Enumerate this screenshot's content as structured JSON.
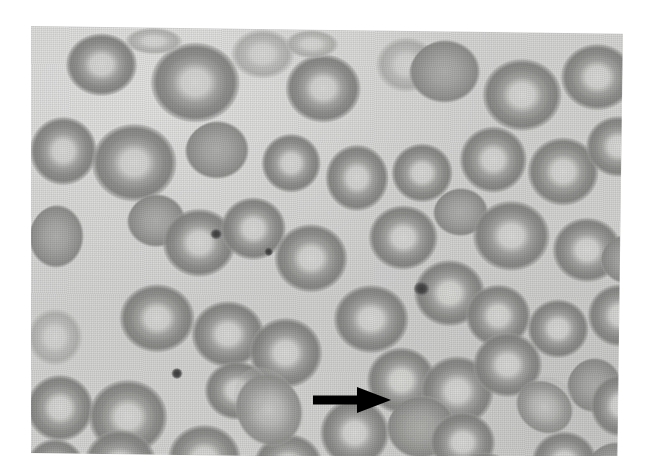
{
  "figure": {
    "kind": "light-microscopy-photomicrograph",
    "staining": "romanowsky-type, reproduced in grayscale",
    "background_color": "#d7d7d5",
    "cell_color": "#a0a0a0",
    "annotation_color": "#000000",
    "page_background": "#ffffff",
    "caption": "",
    "title": "",
    "scale_bar": "",
    "magnification_label": ""
  },
  "annotations": [
    {
      "name": "pointer-arrow",
      "shape": "solid-right-arrow",
      "color": "#000000",
      "label": "",
      "points_to": "red-blood-cell"
    }
  ],
  "cells": [
    {
      "id": "rbc-1",
      "x": 35,
      "y": 6,
      "w": 72,
      "h": 66,
      "style": "deep"
    },
    {
      "id": "rbc-2",
      "x": 120,
      "y": 14,
      "w": 90,
      "h": 84,
      "style": "deep"
    },
    {
      "id": "rbc-3",
      "x": 200,
      "y": 0,
      "w": 64,
      "h": 52,
      "style": "pale"
    },
    {
      "id": "rbc-4",
      "x": 255,
      "y": 24,
      "w": 76,
      "h": 72,
      "style": "deep"
    },
    {
      "id": "rbc-5",
      "x": 345,
      "y": 6,
      "w": 62,
      "h": 58,
      "style": "pale"
    },
    {
      "id": "rbc-6",
      "x": 378,
      "y": 8,
      "w": 80,
      "h": 76,
      "style": "solid"
    },
    {
      "id": "rbc-7",
      "x": 452,
      "y": 26,
      "w": 80,
      "h": 76,
      "style": "deep"
    },
    {
      "id": "rbc-8",
      "x": 530,
      "y": 10,
      "w": 74,
      "h": 70,
      "style": "deep"
    },
    {
      "id": "rbc-9",
      "x": 0,
      "y": 90,
      "w": 68,
      "h": 72,
      "style": "deep"
    },
    {
      "id": "rbc-10",
      "x": 62,
      "y": 96,
      "w": 86,
      "h": 82,
      "style": "deep"
    },
    {
      "id": "rbc-11",
      "x": 155,
      "y": 92,
      "w": 72,
      "h": 70,
      "style": "solid"
    },
    {
      "id": "rbc-12",
      "x": 232,
      "y": 104,
      "w": 60,
      "h": 62,
      "style": "deep"
    },
    {
      "id": "rbc-13",
      "x": 296,
      "y": 114,
      "w": 64,
      "h": 70,
      "style": "deep"
    },
    {
      "id": "rbc-14",
      "x": 362,
      "y": 112,
      "w": 62,
      "h": 62,
      "style": "deep"
    },
    {
      "id": "rbc-15",
      "x": 430,
      "y": 94,
      "w": 68,
      "h": 70,
      "style": "deep"
    },
    {
      "id": "rbc-16",
      "x": 498,
      "y": 104,
      "w": 72,
      "h": 72,
      "style": "deep"
    },
    {
      "id": "rbc-17",
      "x": 556,
      "y": 82,
      "w": 66,
      "h": 64,
      "style": "deep"
    },
    {
      "id": "rbc-18",
      "x": 98,
      "y": 166,
      "w": 66,
      "h": 64,
      "style": "solid"
    },
    {
      "id": "rbc-19",
      "x": 134,
      "y": 180,
      "w": 74,
      "h": 72,
      "style": "deep"
    },
    {
      "id": "rbc-20",
      "x": 192,
      "y": 168,
      "w": 66,
      "h": 66,
      "style": "deep"
    },
    {
      "id": "rbc-21",
      "x": 0,
      "y": 178,
      "w": 62,
      "h": 76,
      "style": "solid"
    },
    {
      "id": "rbc-22",
      "x": 246,
      "y": 194,
      "w": 74,
      "h": 72,
      "style": "deep"
    },
    {
      "id": "rbc-23",
      "x": 340,
      "y": 174,
      "w": 70,
      "h": 68,
      "style": "deep"
    },
    {
      "id": "rbc-24",
      "x": 404,
      "y": 156,
      "w": 62,
      "h": 58,
      "style": "solid"
    },
    {
      "id": "rbc-25",
      "x": 444,
      "y": 168,
      "w": 78,
      "h": 74,
      "style": "deep"
    },
    {
      "id": "rbc-26",
      "x": 524,
      "y": 184,
      "w": 70,
      "h": 68,
      "style": "deep"
    },
    {
      "id": "rbc-27",
      "x": 572,
      "y": 200,
      "w": 62,
      "h": 60,
      "style": "solid"
    },
    {
      "id": "rbc-28",
      "x": 92,
      "y": 256,
      "w": 76,
      "h": 72,
      "style": "deep"
    },
    {
      "id": "rbc-29",
      "x": 164,
      "y": 272,
      "w": 74,
      "h": 70,
      "style": "deep"
    },
    {
      "id": "rbc-30",
      "x": 222,
      "y": 288,
      "w": 74,
      "h": 74,
      "style": "deep"
    },
    {
      "id": "rbc-31",
      "x": 0,
      "y": 282,
      "w": 56,
      "h": 60,
      "style": "pale"
    },
    {
      "id": "rbc-32",
      "x": 306,
      "y": 254,
      "w": 76,
      "h": 72,
      "style": "deep"
    },
    {
      "id": "rbc-33",
      "x": 386,
      "y": 228,
      "w": 72,
      "h": 70,
      "style": "deep"
    },
    {
      "id": "rbc-34",
      "x": 438,
      "y": 252,
      "w": 66,
      "h": 66,
      "style": "deep"
    },
    {
      "id": "rbc-35",
      "x": 500,
      "y": 266,
      "w": 62,
      "h": 62,
      "style": "deep"
    },
    {
      "id": "rbc-36",
      "x": 560,
      "y": 250,
      "w": 66,
      "h": 66,
      "style": "deep"
    },
    {
      "id": "rbc-37",
      "x": 0,
      "y": 348,
      "w": 68,
      "h": 70,
      "style": "deep"
    },
    {
      "id": "rbc-38",
      "x": 62,
      "y": 352,
      "w": 80,
      "h": 78,
      "style": "deep"
    },
    {
      "id": "rbc-39",
      "x": 178,
      "y": 332,
      "w": 66,
      "h": 62,
      "style": "deep"
    },
    {
      "id": "rbc-40",
      "x": 340,
      "y": 316,
      "w": 70,
      "h": 70,
      "style": "deep"
    },
    {
      "id": "rbc-41",
      "x": 394,
      "y": 324,
      "w": 74,
      "h": 74,
      "style": "deep"
    },
    {
      "id": "rbc-42",
      "x": 446,
      "y": 300,
      "w": 70,
      "h": 68,
      "style": "deep"
    },
    {
      "id": "rbc-43",
      "x": 540,
      "y": 324,
      "w": 62,
      "h": 66,
      "style": "solid"
    },
    {
      "id": "rbc-44",
      "x": 564,
      "y": 340,
      "w": 62,
      "h": 66,
      "style": "deep"
    },
    {
      "id": "rbc-45",
      "x": 0,
      "y": 412,
      "w": 60,
      "h": 62,
      "style": "deep"
    },
    {
      "id": "rbc-46",
      "x": 58,
      "y": 402,
      "w": 74,
      "h": 74,
      "style": "deep"
    },
    {
      "id": "rbc-47",
      "x": 142,
      "y": 396,
      "w": 74,
      "h": 72,
      "style": "deep"
    },
    {
      "id": "rbc-48",
      "x": 228,
      "y": 404,
      "w": 70,
      "h": 66,
      "style": "deep"
    },
    {
      "id": "rbc-49",
      "x": 294,
      "y": 368,
      "w": 70,
      "h": 72,
      "style": "deep"
    },
    {
      "id": "rbc-50",
      "x": 360,
      "y": 364,
      "w": 78,
      "h": 76,
      "style": "solid"
    },
    {
      "id": "rbc-51",
      "x": 404,
      "y": 380,
      "w": 66,
      "h": 64,
      "style": "deep"
    },
    {
      "id": "rbc-52",
      "x": 320,
      "y": 432,
      "w": 72,
      "h": 60,
      "style": "deep"
    },
    {
      "id": "rbc-53",
      "x": 426,
      "y": 420,
      "w": 66,
      "h": 58,
      "style": "deep"
    },
    {
      "id": "rbc-54",
      "x": 506,
      "y": 398,
      "w": 66,
      "h": 64,
      "style": "deep"
    },
    {
      "id": "rbc-55",
      "x": 560,
      "y": 408,
      "w": 68,
      "h": 64,
      "style": "solid"
    },
    {
      "id": "rbc-56",
      "x": 254,
      "y": 0,
      "w": 54,
      "h": 30,
      "style": "pale"
    },
    {
      "id": "rbc-57",
      "x": 94,
      "y": 0,
      "w": 58,
      "h": 28,
      "style": "pale"
    }
  ],
  "teardrop_cells": [
    {
      "id": "dacrocyte-1",
      "x": 208,
      "y": 336,
      "w": 66,
      "h": 82,
      "rot": -28
    },
    {
      "id": "dacrocyte-2",
      "x": 490,
      "y": 344,
      "w": 60,
      "h": 56,
      "rot": 34
    }
  ],
  "platelets": [
    {
      "id": "platelet-1",
      "x": 182,
      "y": 200,
      "w": 12,
      "h": 11
    },
    {
      "id": "platelet-2",
      "x": 236,
      "y": 218,
      "w": 9,
      "h": 9
    },
    {
      "id": "platelet-3",
      "x": 386,
      "y": 250,
      "w": 16,
      "h": 15
    },
    {
      "id": "platelet-4",
      "x": 145,
      "y": 340,
      "w": 11,
      "h": 11
    }
  ]
}
